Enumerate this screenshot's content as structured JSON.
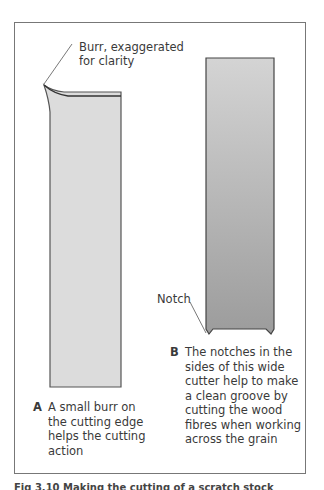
{
  "figure": {
    "labels": {
      "burr": [
        "Burr, exaggerated",
        "for clarity"
      ],
      "notch": "Notch"
    },
    "captions": {
      "a": {
        "letter": "A",
        "text": "A small burr on the cutting edge helps the cutting action"
      },
      "b": {
        "letter": "B",
        "text": "The notches in the sides of this wide cutter help to make a clean groove by cutting the wood fibres when working across the grain"
      }
    },
    "figure_caption": "Fig 3.10  Making the cutting of a scratch stock"
  },
  "colors": {
    "frame": "#777777",
    "cutter_a": "#dcdcdc",
    "cutter_b_top": "#d2d2d2",
    "cutter_b_bottom": "#9a9a9a"
  }
}
